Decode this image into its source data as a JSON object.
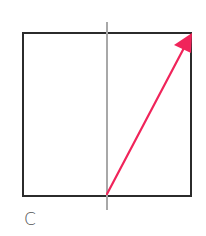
{
  "figure": {
    "panel_label": "C",
    "square": {
      "x": 23,
      "y": 33,
      "width": 168,
      "height": 163,
      "stroke": "#2b2b2b"
    },
    "axis_line": {
      "x": 107,
      "y1": 22,
      "y2": 210,
      "stroke": "#a8a8a8"
    },
    "vector": {
      "from": {
        "x": 107,
        "y": 194
      },
      "to": {
        "x": 191,
        "y": 34
      },
      "color": "#f0245a"
    }
  }
}
